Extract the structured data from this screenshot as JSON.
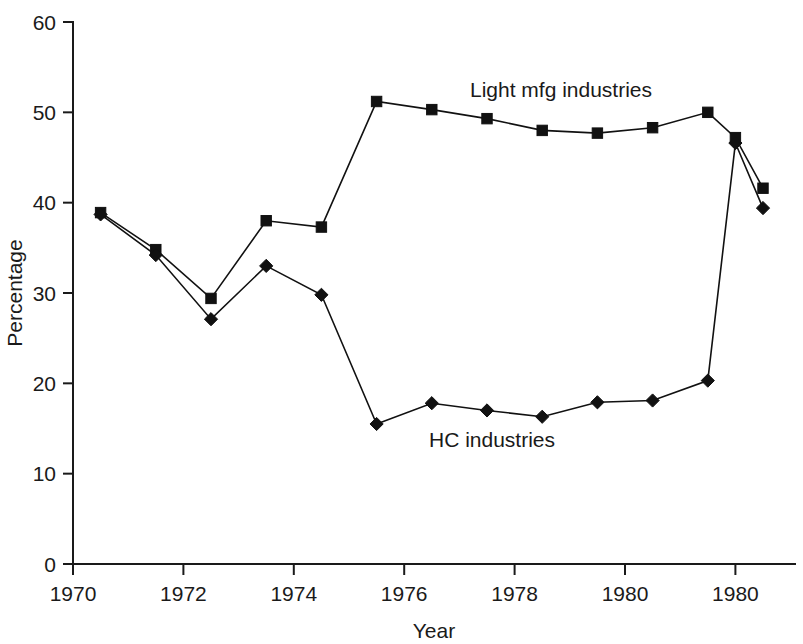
{
  "chart_data": {
    "type": "line",
    "title": "",
    "xlabel": "Year",
    "ylabel": "Percentage",
    "xlim": [
      1970,
      1982.5
    ],
    "ylim": [
      0,
      60
    ],
    "grid": false,
    "legend_position": "inline-annotation",
    "x_tick_labels": [
      "1970",
      "1972",
      "1974",
      "1976",
      "1978",
      "1980",
      "1980"
    ],
    "x_tick_values": [
      1970,
      1972,
      1974,
      1976,
      1978,
      1980,
      1982
    ],
    "y_tick_labels": [
      "0",
      "10",
      "20",
      "30",
      "40",
      "50",
      "60"
    ],
    "y_tick_values": [
      0,
      10,
      20,
      30,
      40,
      50,
      60
    ],
    "x": [
      1970.5,
      1971.5,
      1972.5,
      1973.5,
      1974.5,
      1975.5,
      1976.5,
      1977.5,
      1978.5,
      1979.5,
      1980.5,
      1981.5,
      1982.0,
      1982.5
    ],
    "series": [
      {
        "name": "Light mfg industries",
        "marker": "square",
        "annotation": "Light mfg industries",
        "values": [
          38.9,
          34.8,
          29.4,
          38.0,
          37.3,
          51.2,
          50.3,
          49.3,
          48.0,
          47.7,
          48.3,
          50.0,
          47.2,
          41.6
        ]
      },
      {
        "name": "HC industries",
        "marker": "diamond",
        "annotation": "HC industries",
        "values": [
          38.7,
          34.2,
          27.1,
          33.0,
          29.8,
          15.5,
          17.8,
          17.0,
          16.3,
          17.9,
          18.1,
          20.3,
          46.6,
          39.4
        ]
      }
    ],
    "annotations": [
      {
        "text": "Light mfg industries",
        "x_px": 561,
        "y_px": 97
      },
      {
        "text": "HC industries",
        "x_px": 492,
        "y_px": 447
      }
    ],
    "colors": {
      "axis": "#1a1a1a",
      "line": "#111111",
      "marker": "#111111",
      "background": "#ffffff"
    }
  }
}
